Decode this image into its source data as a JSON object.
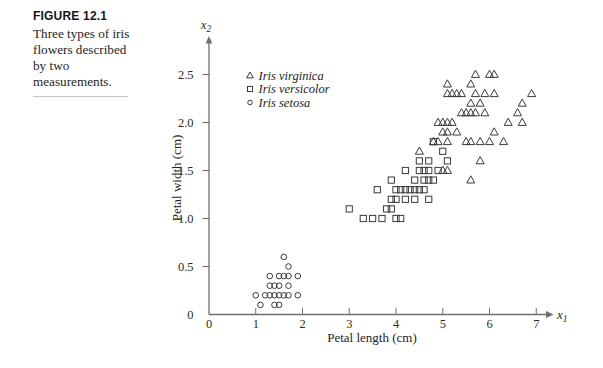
{
  "figure": {
    "label": "FIGURE 12.1",
    "caption_lines": [
      "Three types of iris",
      "flowers described",
      "by two",
      "measurements."
    ]
  },
  "chart_data": {
    "type": "scatter",
    "title": "",
    "xlabel": "Petal length (cm)",
    "ylabel": "Petal width (cm)",
    "x_axis_symbol": {
      "base": "x",
      "sub": "1"
    },
    "y_axis_symbol": {
      "base": "x",
      "sub": "2"
    },
    "xlim": [
      0,
      7.2
    ],
    "ylim": [
      0,
      2.85
    ],
    "xticks": {
      "values": [
        0,
        1,
        2,
        3,
        4,
        5,
        6,
        7
      ],
      "labels": [
        "0",
        "1",
        "2",
        "3",
        "4",
        "5",
        "6",
        "7"
      ]
    },
    "yticks": {
      "values": [
        0,
        0.5,
        1.0,
        1.5,
        2.0,
        2.5
      ],
      "labels": [
        "0",
        "0.5",
        "1.0",
        "1.5",
        "2.0",
        "2.5"
      ]
    },
    "grid": false,
    "legend": {
      "position": "upper-left",
      "items": [
        {
          "marker": "triangle",
          "label": "Iris virginica"
        },
        {
          "marker": "square",
          "label": "Iris versicolor"
        },
        {
          "marker": "circle",
          "label": "Iris setosa"
        }
      ]
    },
    "series": [
      {
        "name": "Iris virginica",
        "marker": "triangle",
        "points": [
          [
            4.5,
            1.7
          ],
          [
            4.8,
            1.8
          ],
          [
            4.9,
            1.8
          ],
          [
            4.9,
            2.0
          ],
          [
            5.0,
            1.5
          ],
          [
            5.0,
            1.9
          ],
          [
            5.0,
            2.0
          ],
          [
            5.1,
            1.5
          ],
          [
            5.1,
            1.8
          ],
          [
            5.1,
            1.9
          ],
          [
            5.1,
            2.0
          ],
          [
            5.1,
            2.3
          ],
          [
            5.1,
            2.4
          ],
          [
            5.2,
            2.0
          ],
          [
            5.2,
            2.3
          ],
          [
            5.3,
            1.9
          ],
          [
            5.3,
            2.3
          ],
          [
            5.4,
            2.1
          ],
          [
            5.4,
            2.3
          ],
          [
            5.5,
            1.8
          ],
          [
            5.5,
            2.1
          ],
          [
            5.6,
            1.4
          ],
          [
            5.6,
            1.8
          ],
          [
            5.6,
            2.1
          ],
          [
            5.6,
            2.2
          ],
          [
            5.6,
            2.4
          ],
          [
            5.7,
            2.1
          ],
          [
            5.7,
            2.3
          ],
          [
            5.7,
            2.5
          ],
          [
            5.8,
            1.6
          ],
          [
            5.8,
            1.8
          ],
          [
            5.8,
            2.2
          ],
          [
            5.9,
            2.1
          ],
          [
            5.9,
            2.3
          ],
          [
            6.0,
            1.8
          ],
          [
            6.0,
            2.5
          ],
          [
            6.1,
            1.9
          ],
          [
            6.1,
            2.3
          ],
          [
            6.1,
            2.5
          ],
          [
            6.3,
            1.8
          ],
          [
            6.4,
            2.0
          ],
          [
            6.6,
            2.1
          ],
          [
            6.7,
            2.0
          ],
          [
            6.7,
            2.2
          ],
          [
            6.9,
            2.3
          ]
        ]
      },
      {
        "name": "Iris versicolor",
        "marker": "square",
        "points": [
          [
            3.0,
            1.1
          ],
          [
            3.3,
            1.0
          ],
          [
            3.5,
            1.0
          ],
          [
            3.6,
            1.3
          ],
          [
            3.7,
            1.0
          ],
          [
            3.8,
            1.1
          ],
          [
            3.9,
            1.1
          ],
          [
            3.9,
            1.2
          ],
          [
            3.9,
            1.4
          ],
          [
            4.0,
            1.0
          ],
          [
            4.0,
            1.2
          ],
          [
            4.0,
            1.3
          ],
          [
            4.1,
            1.0
          ],
          [
            4.1,
            1.3
          ],
          [
            4.2,
            1.2
          ],
          [
            4.2,
            1.3
          ],
          [
            4.2,
            1.5
          ],
          [
            4.3,
            1.3
          ],
          [
            4.4,
            1.2
          ],
          [
            4.4,
            1.3
          ],
          [
            4.4,
            1.4
          ],
          [
            4.5,
            1.3
          ],
          [
            4.5,
            1.5
          ],
          [
            4.5,
            1.6
          ],
          [
            4.6,
            1.3
          ],
          [
            4.6,
            1.4
          ],
          [
            4.6,
            1.5
          ],
          [
            4.7,
            1.2
          ],
          [
            4.7,
            1.4
          ],
          [
            4.7,
            1.5
          ],
          [
            4.7,
            1.6
          ],
          [
            4.8,
            1.4
          ],
          [
            4.8,
            1.8
          ],
          [
            4.9,
            1.5
          ],
          [
            5.0,
            1.7
          ],
          [
            5.1,
            1.6
          ]
        ]
      },
      {
        "name": "Iris setosa",
        "marker": "circle",
        "points": [
          [
            1.0,
            0.2
          ],
          [
            1.1,
            0.1
          ],
          [
            1.2,
            0.2
          ],
          [
            1.3,
            0.2
          ],
          [
            1.3,
            0.3
          ],
          [
            1.3,
            0.4
          ],
          [
            1.4,
            0.1
          ],
          [
            1.4,
            0.2
          ],
          [
            1.4,
            0.3
          ],
          [
            1.5,
            0.1
          ],
          [
            1.5,
            0.2
          ],
          [
            1.5,
            0.3
          ],
          [
            1.5,
            0.4
          ],
          [
            1.6,
            0.2
          ],
          [
            1.6,
            0.4
          ],
          [
            1.6,
            0.6
          ],
          [
            1.7,
            0.2
          ],
          [
            1.7,
            0.3
          ],
          [
            1.7,
            0.4
          ],
          [
            1.7,
            0.5
          ],
          [
            1.9,
            0.2
          ],
          [
            1.9,
            0.4
          ]
        ]
      }
    ]
  },
  "colors": {
    "background": "#ffffff",
    "ink": "#242424",
    "axis": "#6f6f6f",
    "marker_stroke": "#3b3b3b",
    "caption_rule": "#c6c6c6"
  }
}
